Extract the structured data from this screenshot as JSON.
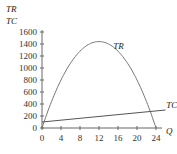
{
  "chart_data": {
    "type": "line",
    "title": "",
    "xlabel": "Q",
    "ylabel": [
      "TR",
      "TC"
    ],
    "xlim": [
      0,
      24
    ],
    "ylim": [
      0,
      1600
    ],
    "x_ticks": [
      "0",
      "4",
      "8",
      "12",
      "16",
      "20",
      "24"
    ],
    "y_ticks": [
      "0",
      "200",
      "400",
      "600",
      "800",
      "1000",
      "1200",
      "1400",
      "1600"
    ],
    "grid": false,
    "series": [
      {
        "name": "TR",
        "x": [
          0,
          2,
          4,
          6,
          8,
          10,
          12,
          14,
          16,
          18,
          20,
          22,
          24
        ],
        "values": [
          0,
          440,
          800,
          1080,
          1280,
          1400,
          1440,
          1400,
          1280,
          1080,
          800,
          440,
          0
        ]
      },
      {
        "name": "TC",
        "x": [
          0,
          26
        ],
        "values": [
          100,
          300
        ]
      }
    ],
    "annotations": [
      {
        "text": "TR",
        "x": 15,
        "y": 1310
      },
      {
        "text": "TC",
        "x": 27,
        "y": 340
      }
    ]
  }
}
